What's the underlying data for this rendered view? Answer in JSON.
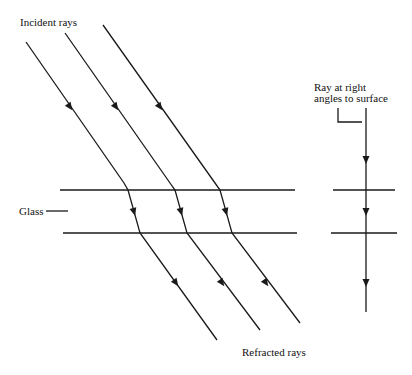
{
  "diagram": {
    "type": "refraction through glass slab",
    "labels": {
      "incident": "Incident rays",
      "glass": "Glass",
      "refracted": "Refracted rays",
      "normal_line1": "Ray at right",
      "normal_line2": "angles to surface"
    },
    "colors": {
      "stroke": "#1a1a1a",
      "background": "#ffffff"
    }
  }
}
